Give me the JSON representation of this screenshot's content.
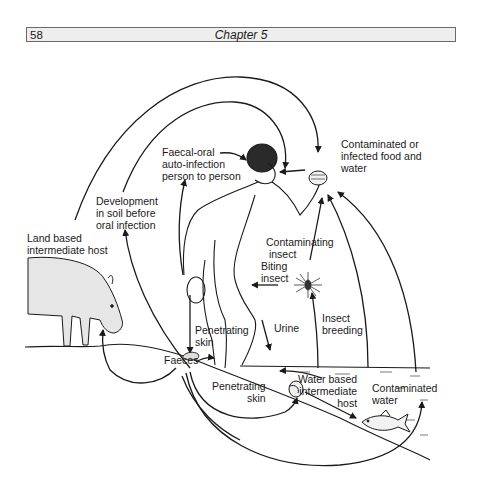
{
  "header": {
    "page_number": "58",
    "chapter_title": "Chapter 5"
  },
  "diagram": {
    "labels": {
      "faecal_oral": "Faecal-oral\nauto-infection\nperson to person",
      "contaminated_food": "Contaminated or\ninfected food and\nwater",
      "development_soil": "Development\nin soil before\noral infection",
      "land_host": "Land based\nintermediate host",
      "contaminating_insect": "Contaminating\n insect",
      "biting_insect": "Biting\ninsect",
      "penetrating_skin_1": "Penetrating\nskin",
      "urine": "Urine",
      "insect_breeding": "Insect\nbreeding",
      "faeces": "Faeces",
      "penetrating_skin_2": "Penetrating\nskin",
      "water_host": "Water based\nintermediate\nhost",
      "contaminated_water": "Contaminated\nwater"
    },
    "figures": [
      "human-figure",
      "pig",
      "fish",
      "insect",
      "food-bowl",
      "snail",
      "faeces-pile"
    ]
  }
}
